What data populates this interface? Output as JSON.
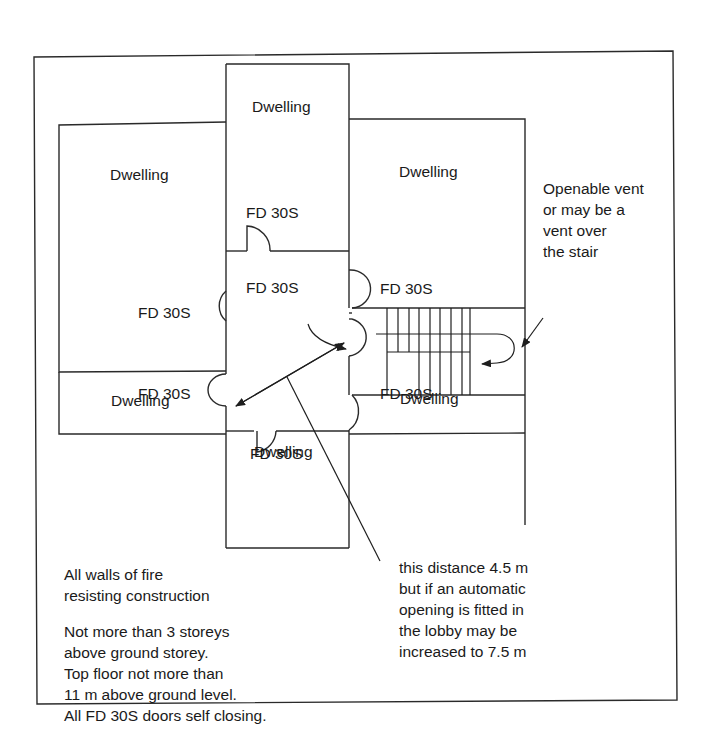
{
  "figure": {
    "caption_number": "Fig. B1.30",
    "caption_title": "Small single-stair building"
  },
  "rooms": {
    "top_center": "Dwelling",
    "top_left": "Dwelling",
    "top_right": "Dwelling",
    "bottom_left": "Dwelling",
    "bottom_right": "Dwelling",
    "bottom_center": "Dwelling"
  },
  "doors": {
    "top_center_door": "FD 30S",
    "lobby_door": "FD 30S",
    "left_upper_door": "FD 30S",
    "stair_upper_door": "FD 30S",
    "left_lower_door": "FD 30S",
    "stair_lower_door": "FD 30S",
    "bottom_center_door": "FD 30S"
  },
  "annotations": {
    "vent": [
      "Openable vent",
      "or may be a",
      "vent over",
      "the stair"
    ],
    "distance": [
      "this distance 4.5 m",
      "but if an automatic",
      "opening is fitted in",
      "the lobby may be",
      "increased to 7.5 m"
    ],
    "walls": [
      "All walls of fire",
      "resisting construction"
    ],
    "limits": [
      "Not more than 3 storeys",
      "above ground storey.",
      "Top floor not more than",
      "11 m above ground level.",
      "All FD 30S doors self closing."
    ]
  }
}
